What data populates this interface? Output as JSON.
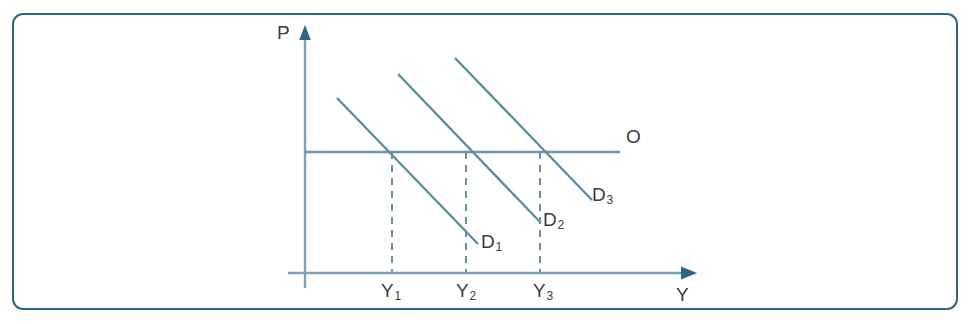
{
  "figure": {
    "kind": "economics-diagram",
    "frame_color": "#2f6489",
    "axis_color": "#7ba4b8",
    "curve_color": "#5c8ba0",
    "supply_color": "#6a97ac",
    "dash_color": "#6d8f9e",
    "label_color": "#3b3b3b"
  },
  "axes": {
    "y_axis_label": "P",
    "x_axis_label": "Y",
    "origin": {
      "x": 305,
      "y": 273
    },
    "y_axis_top": 28,
    "x_axis_right": 697
  },
  "labels": {
    "supply": "O",
    "demand": [
      {
        "name": "D",
        "sub": "1"
      },
      {
        "name": "D",
        "sub": "2"
      },
      {
        "name": "D",
        "sub": "3"
      }
    ],
    "output": [
      {
        "name": "Y",
        "sub": "1"
      },
      {
        "name": "Y",
        "sub": "2"
      },
      {
        "name": "Y",
        "sub": "3"
      }
    ]
  },
  "chart_data": {
    "type": "line",
    "title": "",
    "xlabel": "Y",
    "ylabel": "P",
    "grid": false,
    "legend": "inline-curve-labels",
    "xlim": [
      305,
      697
    ],
    "ylim": [
      273,
      28
    ],
    "series": [
      {
        "name": "O",
        "role": "supply",
        "style": "solid-horizontal",
        "points": [
          {
            "x": 305,
            "y": 152
          },
          {
            "x": 620,
            "y": 152
          }
        ],
        "label_position": {
          "x": 632,
          "y": 137
        }
      },
      {
        "name": "D1",
        "role": "demand",
        "style": "solid-downward-sloping",
        "points": [
          {
            "x": 337,
            "y": 98
          },
          {
            "x": 478,
            "y": 244
          }
        ],
        "intersection": {
          "x": 392,
          "y": 152
        },
        "label_position": {
          "x": 486,
          "y": 243
        }
      },
      {
        "name": "D2",
        "role": "demand",
        "style": "solid-downward-sloping",
        "points": [
          {
            "x": 398,
            "y": 74
          },
          {
            "x": 540,
            "y": 222
          }
        ],
        "intersection": {
          "x": 466,
          "y": 152
        },
        "label_position": {
          "x": 548,
          "y": 221
        }
      },
      {
        "name": "D3",
        "role": "demand",
        "style": "solid-downward-sloping",
        "points": [
          {
            "x": 455,
            "y": 58
          },
          {
            "x": 592,
            "y": 200
          }
        ],
        "intersection": {
          "x": 540,
          "y": 152
        },
        "label_position": {
          "x": 597,
          "y": 196
        }
      }
    ],
    "dashed_guides": [
      {
        "label": "Y1",
        "x": 392,
        "y_from": 152,
        "y_to": 273
      },
      {
        "label": "Y2",
        "x": 466,
        "y_from": 152,
        "y_to": 273
      },
      {
        "label": "Y3",
        "x": 540,
        "y_from": 152,
        "y_to": 273
      }
    ],
    "tick_labels": [
      "Y1",
      "Y2",
      "Y3"
    ],
    "equilibrium_points": [
      {
        "quantity": "Y1",
        "price": "P",
        "on_curve": "D1"
      },
      {
        "quantity": "Y2",
        "price": "P",
        "on_curve": "D2"
      },
      {
        "quantity": "Y3",
        "price": "P",
        "on_curve": "D3"
      }
    ]
  }
}
